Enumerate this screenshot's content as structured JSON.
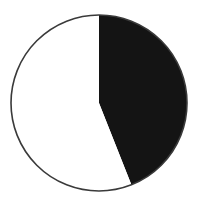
{
  "chart_data": {
    "type": "pie",
    "title": "",
    "categories": [
      "Dark slice",
      "White slice"
    ],
    "values": [
      44,
      56
    ],
    "colors": [
      "#141414",
      "#ffffff"
    ],
    "start_angle_deg": 0,
    "direction": "clockwise",
    "legend": "none",
    "outline_color": "#3a3a3a",
    "center": [
      99,
      103
    ],
    "radius": 88
  }
}
